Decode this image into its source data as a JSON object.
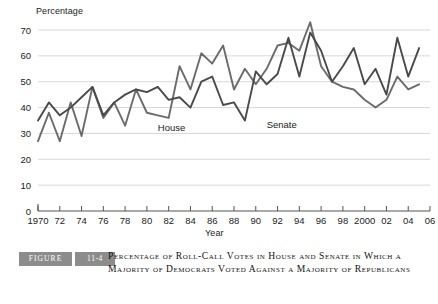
{
  "chart_data": {
    "type": "line",
    "title": "",
    "xlabel": "Year",
    "ylabel": "Percentage",
    "xlim": [
      1970,
      2006
    ],
    "ylim": [
      0,
      70
    ],
    "yticks": [
      0,
      10,
      20,
      30,
      40,
      50,
      60,
      70
    ],
    "xticks": [
      1970,
      1972,
      1974,
      1976,
      1978,
      1980,
      1982,
      1984,
      1986,
      1988,
      1990,
      1992,
      1994,
      1996,
      1998,
      2000,
      2002,
      2004,
      2006
    ],
    "xtick_labels": [
      "1970",
      "72",
      "74",
      "76",
      "78",
      "80",
      "82",
      "84",
      "86",
      "88",
      "90",
      "92",
      "94",
      "96",
      "98",
      "2000",
      "02",
      "04",
      "06"
    ],
    "grid": "horizontal",
    "legend": "inline-labels",
    "x": [
      1970,
      1971,
      1972,
      1973,
      1974,
      1975,
      1976,
      1977,
      1978,
      1979,
      1980,
      1981,
      1982,
      1983,
      1984,
      1985,
      1986,
      1987,
      1988,
      1989,
      1990,
      1991,
      1992,
      1993,
      1994,
      1995,
      1996,
      1997,
      1998,
      1999,
      2000,
      2001,
      2002,
      2003,
      2004,
      2005
    ],
    "series": [
      {
        "name": "House",
        "color": "#6b6b6b",
        "label_x": 1981,
        "label_y": 31,
        "values": [
          27,
          38,
          27,
          42,
          29,
          48,
          36,
          42,
          33,
          47,
          38,
          37,
          36,
          56,
          47,
          61,
          57,
          64,
          47,
          55,
          49,
          55,
          64,
          65,
          62,
          73,
          56,
          50,
          48,
          47,
          43,
          40,
          43,
          52,
          47,
          49
        ]
      },
      {
        "name": "Senate",
        "color": "#4a4a4a",
        "label_x": 1991,
        "label_y": 32,
        "values": [
          35,
          42,
          37,
          40,
          44,
          48,
          37,
          42,
          45,
          47,
          46,
          48,
          43,
          44,
          40,
          50,
          52,
          41,
          42,
          35,
          54,
          49,
          53,
          67,
          52,
          69,
          62,
          50,
          56,
          63,
          49,
          55,
          45,
          67,
          52,
          63
        ]
      }
    ]
  },
  "caption": {
    "badge_figure": "FIGURE",
    "badge_number": "11-4",
    "text": "Percentage of Roll-Call Votes in House and Senate in Which a Majority of Democrats Voted Against a Majority of Republicans"
  }
}
